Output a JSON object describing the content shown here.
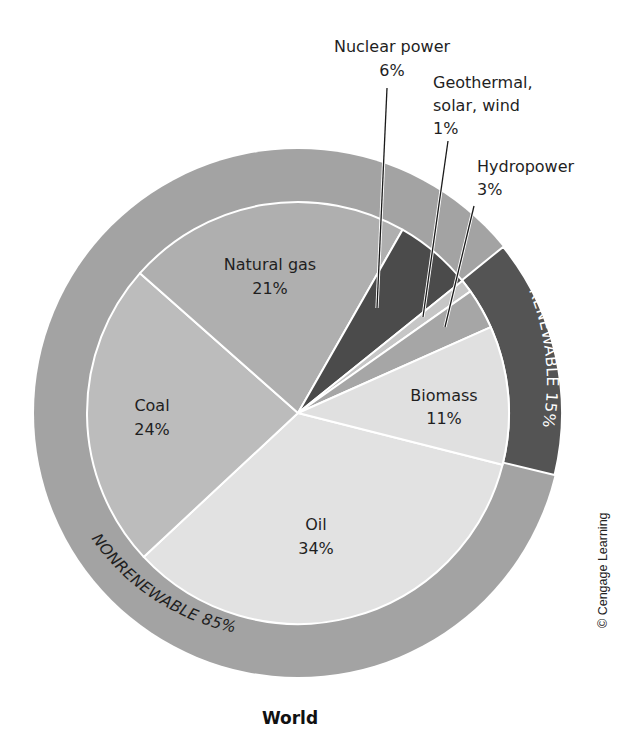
{
  "chart_data": {
    "type": "pie",
    "title": "World",
    "subtitle": "",
    "credit": "© Cengage Learning",
    "center": [
      298,
      413
    ],
    "inner_radius": 211,
    "outer_radius": 264,
    "slices": [
      {
        "name": "Oil",
        "value": 34,
        "label": "Oil",
        "pct": "34%",
        "group": "nonrenewable",
        "color": "#e2e2e2",
        "start_deg": 14.2,
        "end_deg": 137.0
      },
      {
        "name": "Coal",
        "value": 24,
        "label": "Coal",
        "pct": "24%",
        "group": "nonrenewable",
        "color": "#bcbcbc",
        "start_deg": 137.0,
        "end_deg": 221.5
      },
      {
        "name": "Natural gas",
        "value": 21,
        "label": "Natural gas",
        "pct": "21%",
        "group": "nonrenewable",
        "color": "#afafaf",
        "start_deg": 221.5,
        "end_deg": 299.7
      },
      {
        "name": "Nuclear power",
        "value": 6,
        "label": "Nuclear power",
        "pct": "6%",
        "group": "nonrenewable",
        "color": "#4b4b4b",
        "start_deg": 299.7,
        "end_deg": 321.2
      },
      {
        "name": "Geothermal, solar, wind",
        "value": 1,
        "label": "Geothermal, solar, wind",
        "pct": "1%",
        "group": "renewable",
        "color": "#c6c6c6",
        "start_deg": 321.2,
        "end_deg": 324.8
      },
      {
        "name": "Hydropower",
        "value": 3,
        "label": "Hydropower",
        "pct": "3%",
        "group": "renewable",
        "color": "#a6a6a6",
        "start_deg": 324.8,
        "end_deg": 336.0
      },
      {
        "name": "Biomass",
        "value": 11,
        "label": "Biomass",
        "pct": "11%",
        "group": "renewable",
        "color": "#e0e0e0",
        "start_deg": 336.0,
        "end_deg": 374.2
      }
    ],
    "rings": [
      {
        "name": "Nonrenewable",
        "label": "NONRENEWABLE 85%",
        "value": 85,
        "color": "#a3a3a3",
        "start_deg": -39.0,
        "end_deg": 13.6,
        "note": "covers all except renewable arc"
      },
      {
        "name": "Renewable",
        "label": "RENEWABLE 15%",
        "value": 15,
        "color": "#545454",
        "start_deg": -39.0,
        "end_deg": 13.6
      }
    ],
    "legend": null,
    "grid": false
  },
  "labels": {
    "natural_gas": {
      "name": "Natural gas",
      "pct": "21%"
    },
    "coal": {
      "name": "Coal",
      "pct": "24%"
    },
    "oil": {
      "name": "Oil",
      "pct": "34%"
    },
    "biomass": {
      "name": "Biomass",
      "pct": "11%"
    },
    "nuclear": {
      "name": "Nuclear power",
      "pct": "6%"
    },
    "geothermal": {
      "line1": "Geothermal,",
      "line2": "solar, wind",
      "pct": "1%"
    },
    "hydro": {
      "name": "Hydropower",
      "pct": "3%"
    },
    "renewable_ring": "RENEWABLE 15%",
    "nonrenewable_ring": "NONRENEWABLE 85%",
    "title": "World",
    "credit": "© Cengage Learning"
  }
}
